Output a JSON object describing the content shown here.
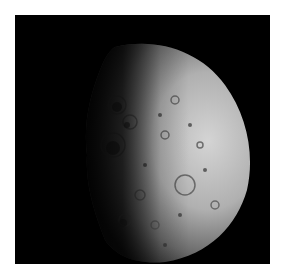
{
  "image": {
    "subject": "cratered asteroid",
    "description": "Grayscale photograph of a heavily cratered asteroid, half-lit from the right, against a black background",
    "colors": {
      "background": "#000000",
      "border": "#ffffff",
      "surface_light": "#c8c8c8",
      "surface_mid": "#8a8a8a",
      "surface_dark": "#2a2a2a"
    }
  }
}
